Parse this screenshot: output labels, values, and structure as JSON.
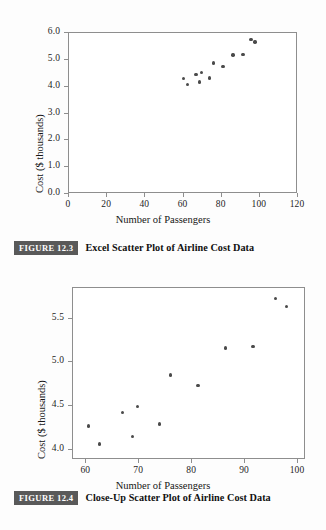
{
  "page": {
    "background_color": "#fdfdfd",
    "ink_color": "#1a1a1a"
  },
  "figures": [
    {
      "id": "figure-12-3",
      "caption_tag": "FIGURE 12.3",
      "caption_text": "Excel Scatter Plot of Airline Cost Data"
    },
    {
      "id": "figure-12-4",
      "caption_tag": "FIGURE 12.4",
      "caption_text": "Close-Up Scatter Plot of Airline Cost Data"
    }
  ],
  "chart_data": [
    {
      "type": "scatter",
      "title": "",
      "xlabel": "Number of Passengers",
      "ylabel": "Cost ($ thousands)",
      "xlim": [
        0,
        120
      ],
      "ylim": [
        0,
        6
      ],
      "xticks": [
        0,
        20,
        40,
        60,
        80,
        100,
        120
      ],
      "yticks": [
        0.0,
        1.0,
        2.0,
        3.0,
        4.0,
        5.0,
        6.0
      ],
      "xtick_labels": [
        "0",
        "20",
        "40",
        "60",
        "80",
        "100",
        "120"
      ],
      "ytick_labels": [
        "0.0",
        "1.0",
        "2.0",
        "3.0",
        "4.0",
        "5.0",
        "6.0"
      ],
      "grid": false,
      "legend": false,
      "marker_color": "#4a4a4a",
      "x": [
        60.6,
        62.7,
        67.0,
        68.9,
        69.9,
        74.0,
        76.1,
        81.3,
        86.5,
        91.7,
        95.9,
        98.0
      ],
      "y": [
        4.26,
        4.05,
        4.41,
        4.14,
        4.48,
        4.28,
        4.84,
        4.72,
        5.15,
        5.17,
        5.72,
        5.63
      ]
    },
    {
      "type": "scatter",
      "title": "",
      "xlabel": "Number of Passengers",
      "ylabel": "Cost ($ thousands)",
      "xlim": [
        57.5,
        101.5
      ],
      "ylim": [
        3.88,
        5.85
      ],
      "xticks": [
        60,
        70,
        80,
        90,
        100
      ],
      "yticks": [
        4.0,
        4.5,
        5.0,
        5.5
      ],
      "xtick_labels": [
        "60",
        "70",
        "80",
        "90",
        "100"
      ],
      "ytick_labels": [
        "4.0",
        "4.5",
        "5.0",
        "5.5"
      ],
      "grid": false,
      "legend": false,
      "marker_color": "#4a4a4a",
      "x": [
        60.6,
        62.7,
        67.0,
        68.9,
        69.9,
        74.0,
        76.1,
        81.3,
        86.5,
        91.7,
        95.9,
        98.0
      ],
      "y": [
        4.26,
        4.05,
        4.41,
        4.14,
        4.48,
        4.28,
        4.84,
        4.72,
        5.15,
        5.17,
        5.72,
        5.63
      ]
    }
  ]
}
